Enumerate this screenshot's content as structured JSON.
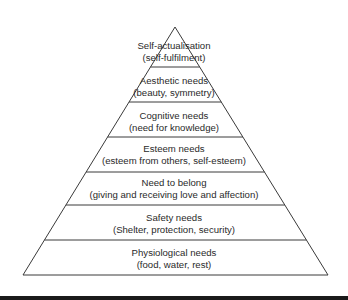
{
  "diagram": {
    "levels": [
      {
        "name": "Self-actualisation",
        "detail": "(self-fulfilment)"
      },
      {
        "name": "Aesthetic needs",
        "detail": "(beauty, symmetry)"
      },
      {
        "name": "Cognitive needs",
        "detail": "(need for knowledge)"
      },
      {
        "name": "Esteem needs",
        "detail": "(esteem from others, self-esteem)"
      },
      {
        "name": "Need to belong",
        "detail": "(giving and receiving love and affection)"
      },
      {
        "name": "Safety needs",
        "detail": "(Shelter, protection, security)"
      },
      {
        "name": "Physiological needs",
        "detail": "(food, water, rest)"
      }
    ],
    "colors": {
      "line": "#3a3a3a",
      "text": "#2a2a2a",
      "background": "#ffffff",
      "bar": "#1a1a1a"
    }
  }
}
